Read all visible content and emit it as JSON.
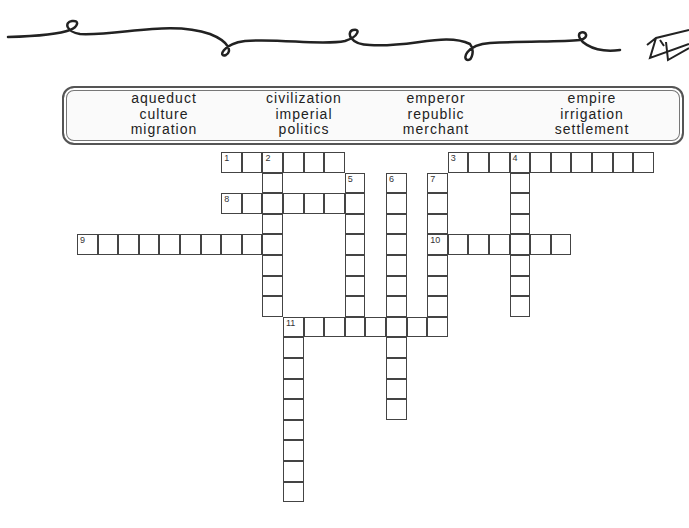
{
  "word_bank": {
    "columns": [
      [
        "aqueduct",
        "culture",
        "migration"
      ],
      [
        "civilization",
        "imperial",
        "politics"
      ],
      [
        "emperor",
        "republic",
        "merchant"
      ],
      [
        "empire",
        "irrigation",
        "settlement"
      ]
    ]
  },
  "grid": {
    "origin_x": 77,
    "origin_y": 152,
    "cell_size": 20.6,
    "entries": [
      {
        "number": "1",
        "direction": "across",
        "col": 7,
        "row": 0,
        "length": 6
      },
      {
        "number": "2",
        "direction": "down",
        "col": 9,
        "row": 0,
        "length": 8
      },
      {
        "number": "3",
        "direction": "across",
        "col": 18,
        "row": 0,
        "length": 10
      },
      {
        "number": "4",
        "direction": "down",
        "col": 21,
        "row": 0,
        "length": 8
      },
      {
        "number": "5",
        "direction": "down",
        "col": 13,
        "row": 1,
        "length": 8
      },
      {
        "number": "6",
        "direction": "down",
        "col": 15,
        "row": 1,
        "length": 12
      },
      {
        "number": "7",
        "direction": "down",
        "col": 17,
        "row": 1,
        "length": 8
      },
      {
        "number": "8",
        "direction": "across",
        "col": 7,
        "row": 2,
        "length": 7
      },
      {
        "number": "9",
        "direction": "across",
        "col": 0,
        "row": 4,
        "length": 10
      },
      {
        "number": "10",
        "direction": "across",
        "col": 17,
        "row": 4,
        "length": 7
      },
      {
        "number": "11",
        "direction": "across",
        "col": 10,
        "row": 8,
        "length": 8
      },
      {
        "number": "11",
        "direction": "down",
        "col": 10,
        "row": 8,
        "length": 9
      }
    ]
  },
  "colors": {
    "line": "#444444",
    "text": "#222222",
    "background": "#ffffff"
  }
}
